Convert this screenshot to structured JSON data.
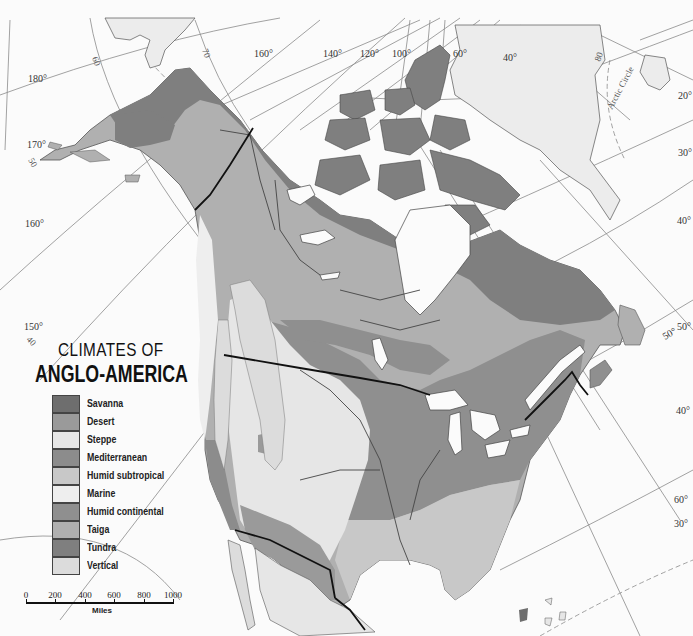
{
  "title": {
    "line1": "CLIMATES OF",
    "line2": "ANGLO-AMERICA"
  },
  "legend": {
    "items": [
      {
        "label": "Savanna",
        "color": "#6e6e6e"
      },
      {
        "label": "Desert",
        "color": "#9a9a9a"
      },
      {
        "label": "Steppe",
        "color": "#e6e6e6"
      },
      {
        "label": "Mediterranean",
        "color": "#8c8c8c"
      },
      {
        "label": "Humid subtropical",
        "color": "#c8c8c8"
      },
      {
        "label": "Marine",
        "color": "#eeeeee"
      },
      {
        "label": "Humid continental",
        "color": "#8f8f8f"
      },
      {
        "label": "Taiga",
        "color": "#b0b0b0"
      },
      {
        "label": "Tundra",
        "color": "#7f7f7f"
      },
      {
        "label": "Vertical",
        "color": "#dcdcdc"
      }
    ]
  },
  "scale": {
    "ticks": [
      "0",
      "200",
      "400",
      "600",
      "800",
      "1000"
    ],
    "unit": "Miles"
  },
  "graticule_labels": {
    "longitudes": [
      "180°",
      "170°",
      "160°",
      "150°",
      "160°",
      "140°",
      "120°",
      "100°",
      "60°",
      "40°",
      "20°",
      "30°",
      "40°",
      "50°",
      "40°",
      "60°",
      "30°"
    ],
    "latitudes": [
      "60",
      "70",
      "50",
      "40",
      "50°",
      "80"
    ],
    "arctic_circle": "Arctic Circle"
  },
  "colors": {
    "background": "#fbfbfb",
    "greenland": "#ececec",
    "tundra": "#7f7f7f",
    "taiga": "#b0b0b0",
    "humid_continental": "#8f8f8f",
    "humid_subtropical": "#c8c8c8",
    "steppe": "#e6e6e6",
    "marine": "#eeeeee",
    "vertical": "#dcdcdc",
    "desert": "#9a9a9a"
  }
}
